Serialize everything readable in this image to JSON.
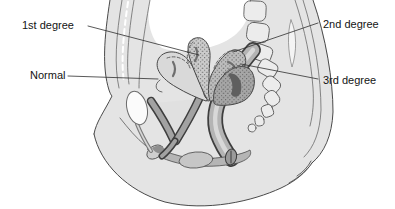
{
  "figure": {
    "type": "medical-diagram",
    "labels": {
      "first_degree": "1st degree",
      "second_degree": "2nd degree",
      "normal": "Normal",
      "third_degree": "3rd degree"
    },
    "colors": {
      "background": "#ffffff",
      "body_fill": "#e4e4e4",
      "outline": "#4a4a4a",
      "bone_fill": "#ececec",
      "canal_wall": "#3e3e3e",
      "uterus_normal_fill": "#d9d9d9",
      "uterus_first_fill": "#cccccc",
      "uterus_second_fill": "#bdbdbd",
      "uterus_third_fill": "#a6a6a6",
      "cavity_dark": "#5f5f5f",
      "label_text": "#141414"
    }
  }
}
